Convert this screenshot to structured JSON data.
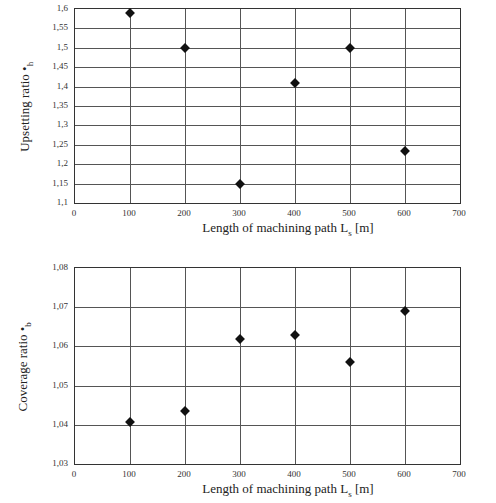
{
  "chart_data": [
    {
      "type": "scatter",
      "title": "",
      "xlabel": "Length of machining path Lₛ [m]",
      "ylabel": "Upsetting ratio •h",
      "x": [
        100,
        200,
        300,
        400,
        500,
        600
      ],
      "values": [
        1.59,
        1.5,
        1.15,
        1.41,
        1.5,
        1.235
      ],
      "xlim": [
        0,
        700
      ],
      "ylim": [
        1.1,
        1.6
      ],
      "xticks": [
        "0",
        "100",
        "200",
        "300",
        "400",
        "500",
        "600",
        "700"
      ],
      "yticks": [
        "1,6",
        "1,55",
        "1,5",
        "1,45",
        "1,4",
        "1,35",
        "1,3",
        "1,25",
        "1,2",
        "1,15",
        "1,1"
      ],
      "grid": true,
      "legend": null,
      "marker": "diamond"
    },
    {
      "type": "scatter",
      "title": "",
      "xlabel": "Length of machining path Lₛ [m]",
      "ylabel": "Coverage ratio •b",
      "x": [
        100,
        200,
        300,
        400,
        500,
        600
      ],
      "values": [
        1.0407,
        1.0435,
        1.062,
        1.063,
        1.056,
        1.069
      ],
      "xlim": [
        0,
        700
      ],
      "ylim": [
        1.03,
        1.08
      ],
      "xticks": [
        "0",
        "100",
        "200",
        "300",
        "400",
        "500",
        "600",
        "700"
      ],
      "yticks": [
        "1,08",
        "1,07",
        "1,06",
        "1,05",
        "1,04",
        "1,03"
      ],
      "grid": true,
      "legend": null,
      "marker": "diamond"
    }
  ],
  "top": {
    "ylabel": "Upsetting ratio •",
    "ylabel_sub": "h",
    "xlabel": "Length of machining path L",
    "xlabel_sub": "s",
    "xlabel_unit": " [m]"
  },
  "bottom": {
    "ylabel": "Coverage ratio •",
    "ylabel_sub": "b",
    "xlabel": "Length of machining path L",
    "xlabel_sub": "s",
    "xlabel_unit": " [m]"
  }
}
